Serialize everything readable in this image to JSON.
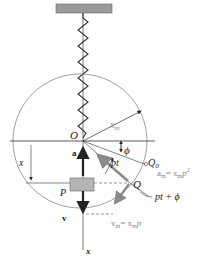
{
  "diagram": {
    "labels": {
      "origin": "O",
      "radius": "x",
      "radius_sub": "m",
      "phase": "ϕ",
      "angle": "pt",
      "q0": "Q",
      "q0_sub": "0",
      "q": "Q",
      "accel_label": "a",
      "accel_eq_lhs": "a",
      "accel_eq_sub": "m",
      "accel_eq_rhs": "= x",
      "accel_eq_rhs_sub": "m",
      "accel_eq_p": "p",
      "accel_eq_exp": "2",
      "phase_total": "pt + ϕ",
      "velocity_label": "v",
      "vel_eq_lhs": "v",
      "vel_eq_sub": "m",
      "vel_eq_rhs": "= x",
      "vel_eq_rhs_sub": "m",
      "vel_eq_p": "p",
      "displacement": "x",
      "mass": "P",
      "axis": "x"
    },
    "colors": {
      "ceiling": "#9a9a9a",
      "mass": "#b5b5b5",
      "arrow_gray": "#8a8a8a",
      "line": "#333333",
      "circle": "#888888"
    }
  }
}
